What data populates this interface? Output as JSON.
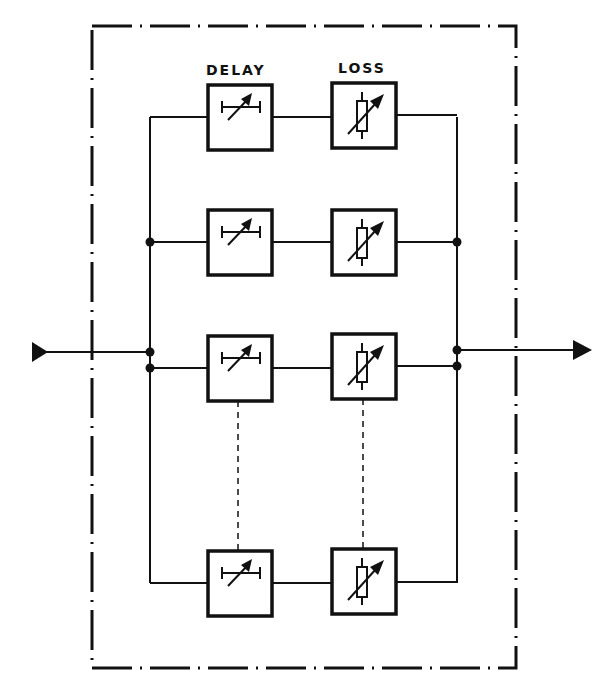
{
  "labels": {
    "delay": "DELAY",
    "loss": "LOSS"
  },
  "colors": {
    "ink": "#111111",
    "background": "#ffffff"
  },
  "rows": [
    {
      "y": 117,
      "delay_box": [
        208,
        85,
        64,
        65
      ],
      "loss_box": [
        332,
        83,
        64,
        65
      ]
    },
    {
      "y": 242,
      "delay_box": [
        208,
        210,
        64,
        65
      ],
      "loss_box": [
        332,
        210,
        64,
        65
      ]
    },
    {
      "y": 368,
      "delay_box": [
        208,
        336,
        64,
        65
      ],
      "loss_box": [
        332,
        334,
        64,
        65
      ]
    },
    {
      "y": 583,
      "delay_box": [
        208,
        551,
        64,
        65
      ],
      "loss_box": [
        332,
        549,
        64,
        65
      ]
    }
  ],
  "icons": {
    "delay": "variable-delay-icon",
    "loss": "variable-resistor-icon",
    "input": "input-arrow-icon",
    "output": "output-arrow-icon"
  }
}
